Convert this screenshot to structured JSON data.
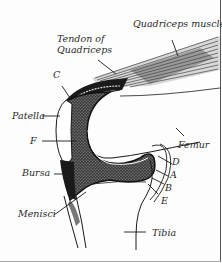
{
  "diagram": {
    "labels": {
      "quadriceps_muscle": "Quadriceps muscle",
      "tendon_of_quadriceps_line1": "Tendon of",
      "tendon_of_quadriceps_line2": "Quadriceps",
      "c": "C",
      "patella": "Patella",
      "f": "F",
      "bursa": "Bursa",
      "menisci": "Menisci",
      "femur": "Femur",
      "d": "D",
      "a": "A",
      "b": "B",
      "e": "E",
      "tibia": "Tibia"
    },
    "colors": {
      "ink": "#1a1a1a",
      "stipple": "#6e6e6e",
      "muscle_fill": "#9a9a9a",
      "background": "#ffffff"
    }
  }
}
